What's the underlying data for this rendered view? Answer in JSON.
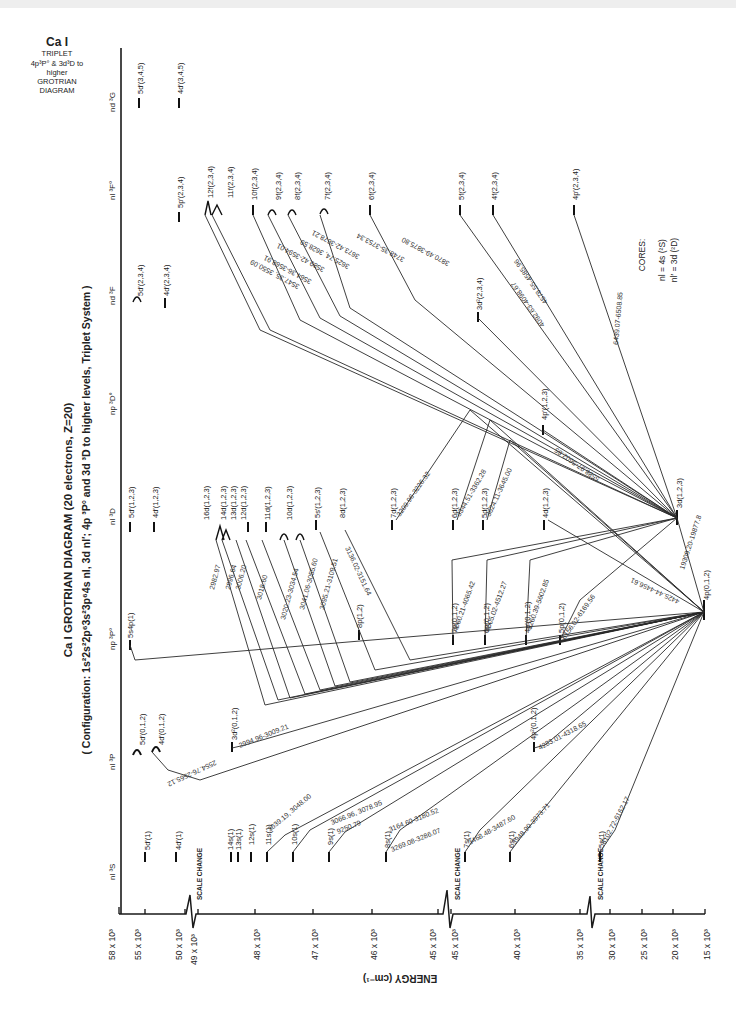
{
  "header_box": {
    "element": "Ca I",
    "line2": "TRIPLET",
    "line3": "4p³P° & 3d³D to",
    "line4": "higher",
    "line5": "GROTRIAN",
    "line6": "DIAGRAM"
  },
  "title": "Ca I GROTRIAN DIAGRAM (20 electrons, Z=20)",
  "subtitle": "( Configuration: 1s²2s²2p⁶3s²3p⁶4s nl, 3d nl′; 4p ³P° and 3d ³D to higher levels, Triplet System )",
  "columns": [
    {
      "id": "nl3S",
      "label": "nl ³S"
    },
    {
      "id": "nl3P",
      "label": "nl ³P"
    },
    {
      "id": "np3Po",
      "label": "np ³P°"
    },
    {
      "id": "nl3D",
      "label": "nl ³D"
    },
    {
      "id": "np3Do",
      "label": "np ³D°"
    },
    {
      "id": "nd3F",
      "label": "nd ³F"
    },
    {
      "id": "nl3Fo",
      "label": "nl ³F°"
    },
    {
      "id": "nd3G",
      "label": "nd ³G"
    }
  ],
  "axis": {
    "label": "ENERGY (cm⁻¹)",
    "ticks": [
      "58 x 10³",
      "55 x 10³",
      "50 x 10³",
      "49 x 10³",
      "48 x 10³",
      "47 x 10³",
      "46 x 10³",
      "45 x 10³",
      "45 x 10³",
      "40 x 10³",
      "35 x 10³",
      "30 x 10³",
      "25 x 10³",
      "20 x 10³",
      "15 x 10³"
    ],
    "scale_change_label": "SCALE CHANGE"
  },
  "cores": {
    "title": "CORES:",
    "line1": "nl = 4s (²S)",
    "line2": "nl′ = 3d (²D)"
  },
  "levels": {
    "nl3S": [
      "5d′(1)",
      "4d′(1)",
      "14s(1)",
      "13s(1)",
      "12s(1)",
      "11s(1)",
      "10s(1)",
      "9s(1)",
      "8s(1)",
      "7s(1)",
      "6s(1)",
      "5s(1)"
    ],
    "nl3P": [
      "5d′(0,1,2)",
      "4d′(0,1,2)",
      "3d²(0,1,2)",
      "4p²(0,1,2)"
    ],
    "np3Po": [
      "5s4p(1)",
      "8p(1,2)",
      "7p(0,1,2)",
      "6p(0,1,2)",
      "4p′(0,1,2)",
      "5p(0,1,2)",
      "4p(0,1,2)"
    ],
    "nl3D": [
      "5d′(1,2,3)",
      "4d′(1,2,3)",
      "16d(1,2,3)",
      "14d(1,2,3)",
      "13d(1,2,3)",
      "12d(1,2,3)",
      "11d(1,2,3)",
      "10d(1,2,3)",
      "5s′(1,2,3)",
      "8d(1,2,3)",
      "7d(1,2,3)",
      "6d(1,2,3)",
      "5d(1,2,3)",
      "4d(1,2,3)",
      "3d(1,2,3)"
    ],
    "np3Do": [
      "4p′(1,2,3)"
    ],
    "nd3F": [
      "5d′(2,3,4)",
      "4d′(2,3,4)",
      "3d²(2,3,4)"
    ],
    "nl3Fo": [
      "5p′(2,3,4)",
      "12f(2,3,4)",
      "11f(2,3,4)",
      "10f(2,3,4)",
      "9f(2,3,4)",
      "8f(2,3,4)",
      "7f(2,3,4)",
      "6f(2,3,4)",
      "5f(2,3,4)",
      "4f(2,3,4)",
      "4p′(2,3,4)"
    ],
    "nd3G": [
      "5d′(3,4,5)",
      "4d′(3,4,5)"
    ]
  },
  "wavelengths": {
    "w01": "2554.76-2565.12",
    "w02": "2994.96-3009.21",
    "w03": "3039.19, 3048.00",
    "w04": "3066.96, 3078.95",
    "w05": "9250.79",
    "w06": "3164.60-3180.52",
    "w07": "3269.08-3286.07",
    "w08": "3468.48-3487.60",
    "w09": "3948.90-3973.71",
    "w10": "4283.01-4318.65",
    "w11": "6102.72-6162.17",
    "w12": "2982.97",
    "w13": "2996.64",
    "w14": "3006.20",
    "w15": "3018.60",
    "w16": "3020.23-3034.54",
    "w17": "3041.06-3055.60",
    "w18": "3095.21-3109.51",
    "w19": "3136.02-3151.64",
    "w20": "3209.96-3226.32",
    "w21": "3344.51-3362.28",
    "w22": "3624.11-3645.00",
    "w23": "4060.21-4065.42",
    "w24": "4505.02-4512.27",
    "w25": "5260.39-5602.85",
    "w26": "6156.02-6169.56",
    "w27": "5588.97-5602.85",
    "w28": "4425.44-4456.61",
    "w29": "19309.20-19877.8",
    "w30": "3547.35, 3550.09",
    "w31": "3564.36-3568.91",
    "w32": "3589.42-3594.01",
    "w33": "3625.74, 3628.59",
    "w34": "3673.42-3678.21",
    "w35": "3748.35-3753.34",
    "w36": "3870.49-3875.80",
    "w37": "4092.63-4098.67",
    "w38": "4578.55-4585.96",
    "w39": "6439.07-6508.85"
  }
}
